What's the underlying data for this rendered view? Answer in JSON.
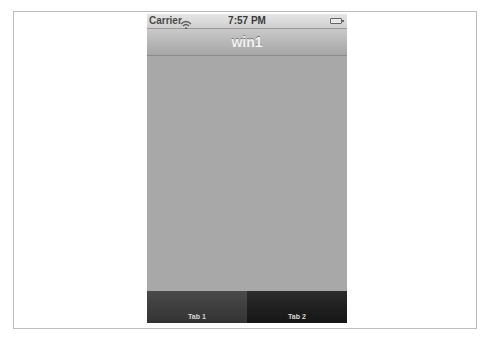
{
  "status_bar": {
    "carrier": "Carrier",
    "wifi_icon": "wifi-icon",
    "time": "7:57 PM",
    "battery_icon": "battery-icon"
  },
  "nav_bar": {
    "title": "win1"
  },
  "content": {
    "background_color": "#a8a8a8"
  },
  "tab_bar": {
    "tabs": [
      {
        "label": "Tab 1",
        "selected": true
      },
      {
        "label": "Tab 2",
        "selected": false
      }
    ]
  }
}
